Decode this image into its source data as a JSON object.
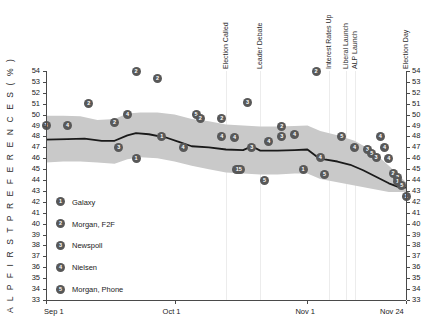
{
  "chart": {
    "ylabel": "A L P   F I R S T   P R E F E R E N C E S   ( % )",
    "xticks": [
      {
        "label": "Sep 1",
        "x": 0
      },
      {
        "label": "Oct 1",
        "x": 30
      },
      {
        "label": "Nov 1",
        "x": 61
      },
      {
        "label": "Nov 24",
        "x": 84
      }
    ],
    "yticks": [
      54,
      53,
      52,
      51,
      50,
      49,
      48,
      47,
      46,
      45,
      44,
      43,
      42,
      41,
      40,
      39,
      38,
      37,
      36,
      35,
      34,
      33
    ],
    "annotations": [
      {
        "label": "Election Called",
        "x": 42
      },
      {
        "label": "Leader Debate",
        "x": 50
      },
      {
        "label": "Interest Rates Up",
        "x": 66
      },
      {
        "label": "Liberal Launch",
        "x": 70
      },
      {
        "label": "ALP Launch",
        "x": 72
      },
      {
        "label": "Election Day",
        "x": 84
      }
    ],
    "legend": [
      {
        "id": "1",
        "label": "Galaxy",
        "y": 42
      },
      {
        "id": "2",
        "label": "Morgan, F2F",
        "y": 40
      },
      {
        "id": "3",
        "label": "Newspoll",
        "y": 38
      },
      {
        "id": "4",
        "label": "Nielsen",
        "y": 36
      },
      {
        "id": "5",
        "label": "Morgan, Phone",
        "y": 34
      }
    ]
  },
  "chart_data": {
    "type": "scatter",
    "title": "",
    "xlabel": "",
    "ylabel": "ALP FIRST PREFERENCES (%)",
    "xlim": [
      0,
      84
    ],
    "ylim": [
      33,
      54
    ],
    "grid": false,
    "legend_position": "inside-lower-left",
    "x_tick_labels": [
      "Sep 1",
      "Oct 1",
      "Nov 1",
      "Nov 24"
    ],
    "x_tick_values": [
      0,
      30,
      61,
      84
    ],
    "series": [
      {
        "name": "Trend (smoothed ALP first preference)",
        "type": "line",
        "color": "#1a1a1a",
        "points": [
          {
            "x": 0,
            "y": 47.7
          },
          {
            "x": 5,
            "y": 47.75
          },
          {
            "x": 9,
            "y": 47.8
          },
          {
            "x": 13,
            "y": 47.6
          },
          {
            "x": 16,
            "y": 47.6
          },
          {
            "x": 19,
            "y": 48.1
          },
          {
            "x": 21,
            "y": 48.3
          },
          {
            "x": 24,
            "y": 48.2
          },
          {
            "x": 28,
            "y": 47.9
          },
          {
            "x": 31,
            "y": 47.5
          },
          {
            "x": 34,
            "y": 47.1
          },
          {
            "x": 38,
            "y": 47.0
          },
          {
            "x": 42,
            "y": 46.8
          },
          {
            "x": 46,
            "y": 46.75
          },
          {
            "x": 48,
            "y": 47.1
          },
          {
            "x": 50,
            "y": 46.7
          },
          {
            "x": 54,
            "y": 46.7
          },
          {
            "x": 58,
            "y": 46.75
          },
          {
            "x": 61,
            "y": 46.8
          },
          {
            "x": 63,
            "y": 46.2
          },
          {
            "x": 65,
            "y": 45.9
          },
          {
            "x": 68,
            "y": 45.7
          },
          {
            "x": 71,
            "y": 45.4
          },
          {
            "x": 74,
            "y": 44.9
          },
          {
            "x": 77,
            "y": 44.3
          },
          {
            "x": 80,
            "y": 43.7
          },
          {
            "x": 82,
            "y": 43.4
          },
          {
            "x": 84,
            "y": 43.3
          }
        ]
      },
      {
        "name": "Confidence band upper",
        "type": "band-upper",
        "points": [
          {
            "x": 0,
            "y": 49.9
          },
          {
            "x": 4,
            "y": 49.9
          },
          {
            "x": 8,
            "y": 49.85
          },
          {
            "x": 12,
            "y": 49.5
          },
          {
            "x": 16,
            "y": 49.6
          },
          {
            "x": 19,
            "y": 50.1
          },
          {
            "x": 22,
            "y": 50.2
          },
          {
            "x": 26,
            "y": 50.2
          },
          {
            "x": 30,
            "y": 50.0
          },
          {
            "x": 34,
            "y": 49.6
          },
          {
            "x": 38,
            "y": 49.4
          },
          {
            "x": 42,
            "y": 49.1
          },
          {
            "x": 46,
            "y": 49.0
          },
          {
            "x": 50,
            "y": 48.9
          },
          {
            "x": 54,
            "y": 48.9
          },
          {
            "x": 58,
            "y": 48.95
          },
          {
            "x": 61,
            "y": 49.0
          },
          {
            "x": 64,
            "y": 48.5
          },
          {
            "x": 68,
            "y": 48.1
          },
          {
            "x": 72,
            "y": 47.6
          },
          {
            "x": 76,
            "y": 46.7
          },
          {
            "x": 80,
            "y": 45.3
          },
          {
            "x": 84,
            "y": 43.8
          }
        ]
      },
      {
        "name": "Confidence band lower",
        "type": "band-lower",
        "points": [
          {
            "x": 0,
            "y": 45.6
          },
          {
            "x": 4,
            "y": 45.7
          },
          {
            "x": 8,
            "y": 45.7
          },
          {
            "x": 12,
            "y": 45.6
          },
          {
            "x": 16,
            "y": 45.5
          },
          {
            "x": 19,
            "y": 45.9
          },
          {
            "x": 22,
            "y": 46.1
          },
          {
            "x": 26,
            "y": 46.0
          },
          {
            "x": 30,
            "y": 45.7
          },
          {
            "x": 34,
            "y": 45.3
          },
          {
            "x": 38,
            "y": 45.0
          },
          {
            "x": 42,
            "y": 44.7
          },
          {
            "x": 46,
            "y": 44.6
          },
          {
            "x": 50,
            "y": 44.5
          },
          {
            "x": 54,
            "y": 44.5
          },
          {
            "x": 58,
            "y": 44.6
          },
          {
            "x": 61,
            "y": 44.6
          },
          {
            "x": 64,
            "y": 44.1
          },
          {
            "x": 68,
            "y": 43.8
          },
          {
            "x": 72,
            "y": 43.5
          },
          {
            "x": 76,
            "y": 43.2
          },
          {
            "x": 80,
            "y": 42.9
          },
          {
            "x": 84,
            "y": 42.9
          }
        ]
      },
      {
        "name": "Poll results",
        "type": "scatter-labeled",
        "points": [
          {
            "x": 0,
            "y": 49.0,
            "id": "3"
          },
          {
            "x": 5,
            "y": 49.0,
            "id": "4"
          },
          {
            "x": 10,
            "y": 51.0,
            "id": "2"
          },
          {
            "x": 16,
            "y": 49.3,
            "id": "2"
          },
          {
            "x": 17,
            "y": 47.0,
            "id": "3"
          },
          {
            "x": 19,
            "y": 50.0,
            "id": "4"
          },
          {
            "x": 21,
            "y": 54.0,
            "id": "2"
          },
          {
            "x": 21,
            "y": 46.0,
            "id": "1"
          },
          {
            "x": 26,
            "y": 53.3,
            "id": "2"
          },
          {
            "x": 27,
            "y": 48.0,
            "id": "1"
          },
          {
            "x": 32,
            "y": 47.0,
            "id": "4"
          },
          {
            "x": 35,
            "y": 50.0,
            "id": "5"
          },
          {
            "x": 36,
            "y": 49.6,
            "id": "2"
          },
          {
            "x": 41,
            "y": 49.6,
            "id": "2"
          },
          {
            "x": 41,
            "y": 48.0,
            "id": "4"
          },
          {
            "x": 44,
            "y": 47.9,
            "id": "4"
          },
          {
            "x": 45,
            "y": 45.0,
            "id": "15"
          },
          {
            "x": 47,
            "y": 51.1,
            "id": "3"
          },
          {
            "x": 48,
            "y": 47.0,
            "id": "3"
          },
          {
            "x": 51,
            "y": 44.0,
            "id": "5"
          },
          {
            "x": 52,
            "y": 47.5,
            "id": "4"
          },
          {
            "x": 55,
            "y": 48.9,
            "id": "2"
          },
          {
            "x": 55,
            "y": 48.0,
            "id": "3"
          },
          {
            "x": 58,
            "y": 48.2,
            "id": "4"
          },
          {
            "x": 60,
            "y": 45.0,
            "id": "1"
          },
          {
            "x": 63,
            "y": 54.0,
            "id": "2"
          },
          {
            "x": 64,
            "y": 46.1,
            "id": "4"
          },
          {
            "x": 65,
            "y": 44.5,
            "id": "5"
          },
          {
            "x": 69,
            "y": 48.0,
            "id": "5"
          },
          {
            "x": 72,
            "y": 47.0,
            "id": "4"
          },
          {
            "x": 75,
            "y": 46.8,
            "id": "3"
          },
          {
            "x": 76,
            "y": 46.4,
            "id": "5"
          },
          {
            "x": 77,
            "y": 46.1,
            "id": "3"
          },
          {
            "x": 78,
            "y": 48.0,
            "id": "4"
          },
          {
            "x": 79,
            "y": 47.0,
            "id": "4"
          },
          {
            "x": 80,
            "y": 46.0,
            "id": "4"
          },
          {
            "x": 81,
            "y": 44.6,
            "id": "2"
          },
          {
            "x": 82,
            "y": 44.2,
            "id": "2"
          },
          {
            "x": 82,
            "y": 43.9,
            "id": "1"
          },
          {
            "x": 83,
            "y": 43.5,
            "id": "5"
          },
          {
            "x": 84,
            "y": 42.5,
            "id": "1"
          }
        ]
      }
    ]
  }
}
